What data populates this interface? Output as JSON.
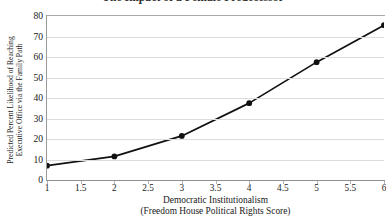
{
  "chart_data": {
    "type": "line",
    "title": "The Impact of a Female Predecessor",
    "xlabel": "Democratic Institutionalism",
    "xlabel_line2": "(Freedom House Political Rights Score)",
    "ylabel": "Predicted Percent Likelihood of Reaching",
    "ylabel_line2": "Executive Office via the Family Path",
    "x": [
      1,
      2,
      3,
      4,
      5,
      6
    ],
    "values": [
      7,
      11.5,
      21.5,
      37.5,
      57.5,
      75.5
    ],
    "series": [
      {
        "name": "Predicted Percent Likelihood",
        "values": [
          7,
          11.5,
          21.5,
          37.5,
          57.5,
          75.5
        ]
      }
    ],
    "xlim": [
      1,
      6
    ],
    "ylim": [
      0,
      80
    ],
    "x_ticks": [
      1,
      1.5,
      2,
      2.5,
      3,
      3.5,
      4,
      4.5,
      5,
      5.5,
      6
    ],
    "x_tick_labels": [
      "1",
      "1.5",
      "2",
      "2.5",
      "3",
      "3.5",
      "4",
      "4.5",
      "5",
      "5.5",
      "6"
    ],
    "y_ticks": [
      0,
      10,
      20,
      30,
      40,
      50,
      60,
      70,
      80
    ],
    "y_tick_labels": [
      "0",
      "10",
      "20",
      "30",
      "40",
      "50",
      "60",
      "70",
      "80"
    ],
    "grid": "horizontal",
    "legend": "none",
    "line_color": "#111111",
    "marker_color": "#111111",
    "marker_style": "circle",
    "grid_color": "#dcdcdc",
    "axis_color": "#9a9a9a",
    "background_color": "#ffffff"
  }
}
